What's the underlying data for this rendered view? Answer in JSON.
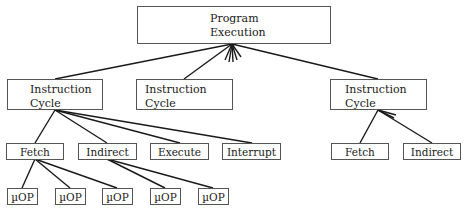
{
  "diagram": {
    "root": {
      "line1": "Program",
      "line2": "Execution"
    },
    "instruction_cycles": [
      {
        "line1": "Instruction",
        "line2": "Cycle"
      },
      {
        "line1": "Instruction",
        "line2": "Cycle"
      },
      {
        "line1": "Instruction",
        "line2": "Cycle"
      }
    ],
    "left_cycle_children": [
      "Fetch",
      "Indirect",
      "Execute",
      "Interrupt"
    ],
    "right_cycle_children": [
      "Fetch",
      "Indirect"
    ],
    "micro_ops": [
      "µOP",
      "µOP",
      "µOP",
      "µOP",
      "µOP"
    ]
  },
  "colors": {
    "line": "#1a1a1a",
    "border": "#555555",
    "background": "#ffffff"
  }
}
